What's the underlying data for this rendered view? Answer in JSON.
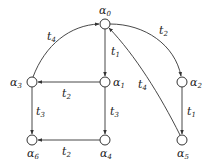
{
  "diagram": {
    "type": "state-transition-graph",
    "nodes": [
      {
        "id": "a0",
        "base": "α",
        "sub": "0",
        "x": 105,
        "y": 24,
        "lx": 105,
        "ly": 14,
        "anchor": "middle"
      },
      {
        "id": "a1",
        "base": "α",
        "sub": "1",
        "x": 105,
        "y": 82,
        "lx": 114,
        "ly": 86,
        "anchor": "start"
      },
      {
        "id": "a2",
        "base": "α",
        "sub": "2",
        "x": 182,
        "y": 82,
        "lx": 191,
        "ly": 86,
        "anchor": "start"
      },
      {
        "id": "a3",
        "base": "α",
        "sub": "3",
        "x": 32,
        "y": 82,
        "lx": 23,
        "ly": 86,
        "anchor": "end"
      },
      {
        "id": "a4",
        "base": "α",
        "sub": "4",
        "x": 105,
        "y": 140,
        "lx": 105,
        "ly": 157,
        "anchor": "middle"
      },
      {
        "id": "a5",
        "base": "α",
        "sub": "5",
        "x": 182,
        "y": 140,
        "lx": 182,
        "ly": 157,
        "anchor": "middle"
      },
      {
        "id": "a6",
        "base": "α",
        "sub": "6",
        "x": 32,
        "y": 140,
        "lx": 32,
        "ly": 157,
        "anchor": "middle"
      }
    ],
    "edges": [
      {
        "from": "a3",
        "to": "a0",
        "label_base": "t",
        "label_sub": "4",
        "curved": true
      },
      {
        "from": "a0",
        "to": "a2",
        "label_base": "t",
        "label_sub": "2",
        "curved": true
      },
      {
        "from": "a0",
        "to": "a1",
        "label_base": "t",
        "label_sub": "1"
      },
      {
        "from": "a1",
        "to": "a3",
        "label_base": "t",
        "label_sub": "2"
      },
      {
        "from": "a3",
        "to": "a6",
        "label_base": "t",
        "label_sub": "3"
      },
      {
        "from": "a1",
        "to": "a4",
        "label_base": "t",
        "label_sub": "3"
      },
      {
        "from": "a4",
        "to": "a6",
        "label_base": "t",
        "label_sub": "2"
      },
      {
        "from": "a2",
        "to": "a5",
        "label_base": "t",
        "label_sub": "1"
      },
      {
        "from": "a5",
        "to": "a0",
        "label_base": "t",
        "label_sub": "4",
        "curved": true
      }
    ]
  },
  "labels": {
    "a0": "α",
    "a0s": "0",
    "a1": "α",
    "a1s": "1",
    "a2": "α",
    "a2s": "2",
    "a3": "α",
    "a3s": "3",
    "a4": "α",
    "a4s": "4",
    "a5": "α",
    "a5s": "5",
    "a6": "α",
    "a6s": "6",
    "e_a3_a0": "t",
    "e_a3_a0s": "4",
    "e_a0_a2": "t",
    "e_a0_a2s": "2",
    "e_a0_a1": "t",
    "e_a0_a1s": "1",
    "e_a1_a3": "t",
    "e_a1_a3s": "2",
    "e_a3_a6": "t",
    "e_a3_a6s": "3",
    "e_a1_a4": "t",
    "e_a1_a4s": "3",
    "e_a4_a6": "t",
    "e_a4_a6s": "2",
    "e_a2_a5": "t",
    "e_a2_a5s": "1",
    "e_a5_a0": "t",
    "e_a5_a0s": "4"
  }
}
